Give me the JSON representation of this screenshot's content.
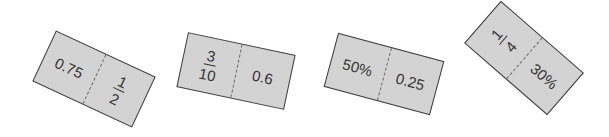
{
  "cards": [
    {
      "left": {
        "type": "text",
        "value": "0.75"
      },
      "right": {
        "type": "fraction",
        "numerator": "1",
        "denominator": "2"
      }
    },
    {
      "left": {
        "type": "fraction",
        "numerator": "3",
        "denominator": "10"
      },
      "right": {
        "type": "text",
        "value": "0.6"
      }
    },
    {
      "left": {
        "type": "text",
        "value": "50%"
      },
      "right": {
        "type": "text",
        "value": "0.25"
      }
    },
    {
      "left": {
        "type": "fraction",
        "numerator": "1",
        "denominator": "4"
      },
      "right": {
        "type": "text",
        "value": "30%"
      }
    }
  ],
  "colors": {
    "card_fill": "#d3d3d3",
    "card_border": "#3c3c3c",
    "text": "#333333"
  }
}
